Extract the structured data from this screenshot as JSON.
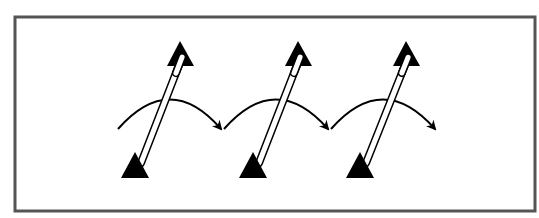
{
  "diagram": {
    "description": "Three double-lined rods, each with a filled triangle at both ends, tilted diagonally; a curved arrow sweeps left-to-right across each rod's midsection, repeated three times in sequence.",
    "frame": {
      "x": 15,
      "y": 17,
      "width": 520,
      "height": 194,
      "stroke": "#555555",
      "stroke_width": 3,
      "fill": "#ffffff"
    },
    "colors": {
      "ink": "#000000",
      "rod_fill": "#ffffff"
    },
    "groups": [
      {
        "id": 1,
        "bottom_triangle": {
          "apex": [
            135,
            152
          ],
          "base_left": [
            121,
            178
          ],
          "base_right": [
            149,
            178
          ]
        },
        "top_triangle": {
          "apex": [
            180,
            41
          ],
          "base_left": [
            167,
            66
          ],
          "base_right": [
            194,
            66
          ]
        },
        "rod": {
          "from": [
            141,
            163
          ],
          "to": [
            181,
            60
          ],
          "width": 6
        },
        "arc": {
          "start": [
            118,
            129
          ],
          "control": [
            170,
            70
          ],
          "end": [
            221,
            129
          ]
        }
      },
      {
        "id": 2,
        "bottom_triangle": {
          "apex": [
            253,
            152
          ],
          "base_left": [
            239,
            178
          ],
          "base_right": [
            267,
            178
          ]
        },
        "top_triangle": {
          "apex": [
            298,
            41
          ],
          "base_left": [
            285,
            66
          ],
          "base_right": [
            312,
            66
          ]
        },
        "rod": {
          "from": [
            259,
            163
          ],
          "to": [
            299,
            60
          ],
          "width": 6
        },
        "arc": {
          "start": [
            224,
            129
          ],
          "control": [
            276,
            70
          ],
          "end": [
            328,
            129
          ]
        }
      },
      {
        "id": 3,
        "bottom_triangle": {
          "apex": [
            360,
            152
          ],
          "base_left": [
            346,
            178
          ],
          "base_right": [
            374,
            178
          ]
        },
        "top_triangle": {
          "apex": [
            406,
            41
          ],
          "base_left": [
            393,
            66
          ],
          "base_right": [
            420,
            66
          ]
        },
        "rod": {
          "from": [
            366,
            163
          ],
          "to": [
            407,
            60
          ],
          "width": 6
        },
        "arc": {
          "start": [
            331,
            129
          ],
          "control": [
            383,
            70
          ],
          "end": [
            435,
            129
          ]
        }
      }
    ]
  }
}
